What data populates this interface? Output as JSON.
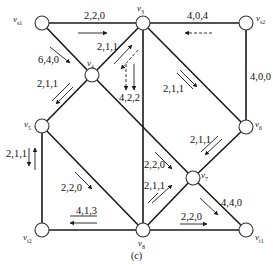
{
  "diagram": {
    "caption": "(c)",
    "colors": {
      "edge": "#1a1a1a",
      "node_fill": "#ffffff",
      "node_stroke": "#333333",
      "background": "#ffffff"
    },
    "nodes": [
      {
        "id": "vs1",
        "label": "v",
        "sub": "s1",
        "x": 42,
        "y": 23
      },
      {
        "id": "v3",
        "label": "v",
        "sub": "3",
        "x": 143,
        "y": 23
      },
      {
        "id": "vs2",
        "label": "v",
        "sub": "s2",
        "x": 246,
        "y": 23
      },
      {
        "id": "v4",
        "label": "v",
        "sub": "4",
        "x": 92,
        "y": 75
      },
      {
        "id": "v5",
        "label": "v",
        "sub": "5",
        "x": 42,
        "y": 126
      },
      {
        "id": "v6",
        "label": "v",
        "sub": "6",
        "x": 246,
        "y": 127
      },
      {
        "id": "v7",
        "label": "v",
        "sub": "7",
        "x": 193,
        "y": 178
      },
      {
        "id": "vt2",
        "label": "v",
        "sub": "t2",
        "x": 42,
        "y": 230
      },
      {
        "id": "v8",
        "label": "v",
        "sub": "8",
        "x": 143,
        "y": 230
      },
      {
        "id": "vt1",
        "label": "v",
        "sub": "t1",
        "x": 246,
        "y": 230
      }
    ],
    "edges": [
      {
        "from": "vs1",
        "to": "v3",
        "label": "2,2,0"
      },
      {
        "from": "v3",
        "to": "vs2",
        "label": "4,0,4"
      },
      {
        "from": "vs2",
        "to": "v6",
        "label": "4,0,0"
      },
      {
        "from": "vs1",
        "to": "v4",
        "label": "6,4,0"
      },
      {
        "from": "v4",
        "to": "v3",
        "label": "2,1,1"
      },
      {
        "from": "v3",
        "to": "v8",
        "label": "4,2,2"
      },
      {
        "from": "v3",
        "to": "v6",
        "label": "2,1,1"
      },
      {
        "from": "v4",
        "to": "v5",
        "label": "2,1,1"
      },
      {
        "from": "v4",
        "to": "v7",
        "label": "2,2,0"
      },
      {
        "from": "v6",
        "to": "v7",
        "label": "2,1,1"
      },
      {
        "from": "v5",
        "to": "vt2",
        "label": "2,1,1"
      },
      {
        "from": "v5",
        "to": "v8",
        "label": "2,2,0"
      },
      {
        "from": "v7",
        "to": "v8",
        "label": "2,1,1"
      },
      {
        "from": "v8",
        "to": "vt2",
        "label": "4,1,3"
      },
      {
        "from": "v7",
        "to": "vt1",
        "label": "4,4,0"
      },
      {
        "from": "v8",
        "to": "vt1",
        "label": "2,2,0"
      }
    ]
  }
}
